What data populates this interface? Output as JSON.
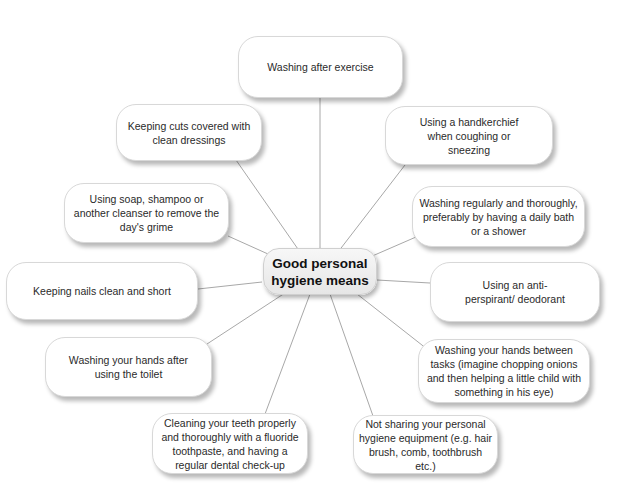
{
  "diagram": {
    "type": "mind-map",
    "center": {
      "label_line1": "Good personal",
      "label_line2": "hygiene means"
    },
    "colors": {
      "line": "#a8a8a8",
      "box_border": "#d8d8d8",
      "text": "#2a2a2a",
      "background": "#ffffff"
    },
    "nodes": [
      {
        "id": "washing-after-exercise",
        "label": "Washing after exercise"
      },
      {
        "id": "keeping-cuts-covered",
        "label": "Keeping cuts covered with clean dressings"
      },
      {
        "id": "using-handkerchief",
        "label": "Using a handkerchief when coughing or sneezing"
      },
      {
        "id": "using-soap",
        "label": "Using soap, shampoo or another cleanser to remove the day's grime"
      },
      {
        "id": "washing-regularly",
        "label": "Washing regularly and thoroughly, preferably by having a daily bath or a shower"
      },
      {
        "id": "keeping-nails",
        "label": "Keeping nails clean and short"
      },
      {
        "id": "anti-perspirant",
        "label": "Using an anti-perspirant/ deodorant"
      },
      {
        "id": "washing-hands-toilet",
        "label": "Washing your hands after using the toilet"
      },
      {
        "id": "washing-hands-tasks",
        "label": "Washing your hands between tasks (imagine chopping onions and then helping a little child with something in his eye)"
      },
      {
        "id": "cleaning-teeth",
        "label": "Cleaning your teeth properly and thoroughly with a fluoride toothpaste, and having a regular dental check-up"
      },
      {
        "id": "not-sharing",
        "label": "Not sharing your personal hygiene equipment (e.g. hair brush, comb, toothbrush etc.)"
      }
    ]
  }
}
